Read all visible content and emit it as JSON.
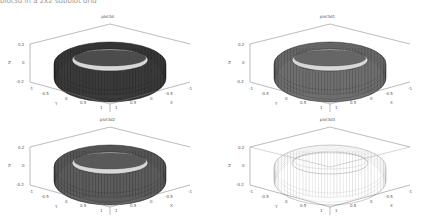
{
  "header": {
    "cut_text": "plot3d in a 2x2 subplot grid"
  },
  "chart_data": [
    {
      "type": "surface3d",
      "title": "plot3d",
      "shape": "torus",
      "style": "dark shaded mesh",
      "face_color": "#3a3a3a",
      "edge_color": "#111111",
      "zlabel": "Z",
      "ylabel": "Y",
      "xlabel": "X",
      "z_ticks": [
        "0.2",
        "0",
        "-0.2"
      ],
      "y_ticks": [
        "-1",
        "-0.5",
        "0",
        "0.5",
        "1"
      ],
      "x_ticks": [
        "1",
        "0.5",
        "0",
        "-0.5",
        "-1"
      ],
      "zlim": [
        -0.2,
        0.2
      ],
      "xlim": [
        -1,
        1
      ],
      "ylim": [
        -1,
        1
      ],
      "grid": false
    },
    {
      "type": "surface3d",
      "title": "plot3d1",
      "shape": "torus",
      "style": "gray shaded mesh",
      "face_color": "#6a6a6a",
      "edge_color": "#222222",
      "zlabel": "Z",
      "ylabel": "Y",
      "xlabel": "X",
      "z_ticks": [
        "0.2",
        "0",
        "-0.2"
      ],
      "y_ticks": [
        "-1",
        "-0.5",
        "0",
        "0.5",
        "1"
      ],
      "x_ticks": [
        "1",
        "0.5",
        "0",
        "-0.5",
        "-1"
      ],
      "zlim": [
        -0.2,
        0.2
      ],
      "xlim": [
        -1,
        1
      ],
      "ylim": [
        -1,
        1
      ],
      "grid": false
    },
    {
      "type": "surface3d",
      "title": "plot3d2",
      "shape": "torus",
      "style": "medium shaded mesh",
      "face_color": "#5a5a5a",
      "edge_color": "#1a1a1a",
      "zlabel": "Z",
      "ylabel": "Y",
      "xlabel": "X",
      "z_ticks": [
        "0.2",
        "0",
        "-0.2"
      ],
      "y_ticks": [
        "-1",
        "-0.5",
        "0",
        "0.5",
        "1"
      ],
      "x_ticks": [
        "1",
        "0.5",
        "0",
        "-0.5",
        "-1"
      ],
      "zlim": [
        -0.2,
        0.2
      ],
      "xlim": [
        -1,
        1
      ],
      "ylim": [
        -1,
        1
      ],
      "grid": false
    },
    {
      "type": "surface3d",
      "title": "plot3d3",
      "shape": "torus",
      "style": "wireframe only",
      "face_color": "none",
      "edge_color": "#8a8a8a",
      "zlabel": "Z",
      "ylabel": "Y",
      "xlabel": "X",
      "z_ticks": [
        "0.2",
        "0",
        "-0.2"
      ],
      "y_ticks": [
        "-1",
        "-0.5",
        "0",
        "0.5",
        "1"
      ],
      "x_ticks": [
        "1",
        "0.5",
        "0",
        "-0.5",
        "-1"
      ],
      "zlim": [
        -0.2,
        0.2
      ],
      "xlim": [
        -1,
        1
      ],
      "ylim": [
        -1,
        1
      ],
      "grid": false
    }
  ],
  "panels": [
    {
      "title": "plot3d",
      "zlabel": "Z",
      "y": "Y",
      "x": "X",
      "z0": "0.2",
      "z1": "0",
      "z2": "-0.2",
      "y0": "-1",
      "y1": "-0.5",
      "y2": "0",
      "y3": "0.5",
      "y4": "1",
      "x0": "1",
      "x1": "0.5",
      "x2": "0",
      "x3": "-0.5",
      "x4": "-1"
    },
    {
      "title": "plot3d1",
      "zlabel": "Z",
      "y": "Y",
      "x": "X",
      "z0": "0.2",
      "z1": "0",
      "z2": "-0.2",
      "y0": "-1",
      "y1": "-0.5",
      "y2": "0",
      "y3": "0.5",
      "y4": "1",
      "x0": "1",
      "x1": "0.5",
      "x2": "0",
      "x3": "-0.5",
      "x4": "-1"
    },
    {
      "title": "plot3d2",
      "zlabel": "Z",
      "y": "Y",
      "x": "X",
      "z0": "0.2",
      "z1": "0",
      "z2": "-0.2",
      "y0": "-1",
      "y1": "-0.5",
      "y2": "0",
      "y3": "0.5",
      "y4": "1",
      "x0": "1",
      "x1": "0.5",
      "x2": "0",
      "x3": "-0.5",
      "x4": "-1"
    },
    {
      "title": "plot3d3",
      "zlabel": "Z",
      "y": "Y",
      "x": "X",
      "z0": "0.2",
      "z1": "0",
      "z2": "-0.2",
      "y0": "-1",
      "y1": "-0.5",
      "y2": "0",
      "y3": "0.5",
      "y4": "1",
      "x0": "1",
      "x1": "0.5",
      "x2": "0",
      "x3": "-0.5",
      "x4": "-1"
    }
  ]
}
